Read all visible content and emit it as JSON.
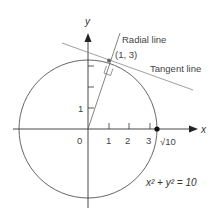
{
  "diagram": {
    "axes": {
      "x_label": "x",
      "y_label": "y"
    },
    "x_ticks": [
      "0",
      "1",
      "2",
      "3"
    ],
    "y_ticks": [
      "1"
    ],
    "sqrt10_label": "√10",
    "point_label": "(1, 3)",
    "radial_label": "Radial line",
    "tangent_label": "Tangent line",
    "equation": "x² + y² = 10",
    "colors": {
      "circle": "#555555",
      "lines": "#888888",
      "axes": "#333333"
    }
  }
}
